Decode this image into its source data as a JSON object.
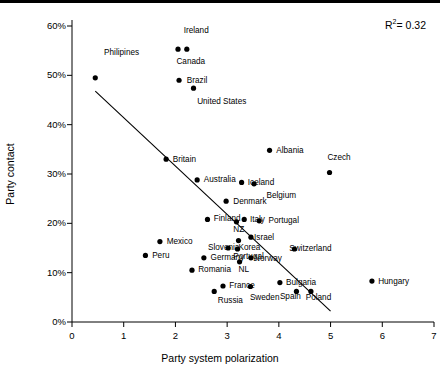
{
  "chart_data": {
    "type": "scatter",
    "title": "",
    "xlabel": "Party system polarization",
    "ylabel": "Party contact",
    "xlim": [
      0,
      7
    ],
    "ylim": [
      0,
      0.6
    ],
    "grid": false,
    "legend": "none",
    "xticks": [
      "0",
      "1",
      "2",
      "3",
      "4",
      "5",
      "6",
      "7"
    ],
    "xtick_values": [
      0,
      1,
      2,
      3,
      4,
      5,
      6,
      7
    ],
    "yticks": [
      "0%",
      "10%",
      "20%",
      "30%",
      "40%",
      "50%",
      "60%"
    ],
    "ytick_values": [
      0,
      0.1,
      0.2,
      0.3,
      0.4,
      0.5,
      0.6
    ],
    "annotations": [
      {
        "name": "r-squared",
        "text": "R2=0.32",
        "r_label": "R",
        "exponent": "2",
        "value": "= 0.32"
      }
    ],
    "trendline": {
      "type": "linear",
      "x_start": 0.45,
      "y_start": 0.468,
      "x_end": 5.0,
      "y_end": 0.022
    },
    "point_color": "#000000",
    "points": [
      {
        "label": "Philipines",
        "x": 0.45,
        "y": 0.495,
        "lx": 0.62,
        "ly": 0.543
      },
      {
        "label": "Ireland",
        "x": 2.05,
        "y": 0.553,
        "lx": 2.16,
        "ly": 0.588
      },
      {
        "label": "Canada",
        "x": 2.22,
        "y": 0.553,
        "lx": 2.02,
        "ly": 0.525
      },
      {
        "label": "Brazil",
        "x": 2.07,
        "y": 0.49,
        "lx": 2.22,
        "ly": 0.487
      },
      {
        "label": "United States",
        "x": 2.35,
        "y": 0.474,
        "lx": 2.42,
        "ly": 0.443
      },
      {
        "label": "Britain",
        "x": 1.82,
        "y": 0.33,
        "lx": 1.95,
        "ly": 0.327
      },
      {
        "label": "Albania",
        "x": 3.82,
        "y": 0.348,
        "lx": 3.95,
        "ly": 0.345
      },
      {
        "label": "Czech",
        "x": 4.98,
        "y": 0.303,
        "lx": 4.94,
        "ly": 0.33
      },
      {
        "label": "Australia",
        "x": 2.42,
        "y": 0.288,
        "lx": 2.55,
        "ly": 0.285
      },
      {
        "label": "Iceland",
        "x": 3.28,
        "y": 0.283,
        "lx": 3.4,
        "ly": 0.28
      },
      {
        "label": "Belgium",
        "x": 3.52,
        "y": 0.28,
        "lx": 3.76,
        "ly": 0.253
      },
      {
        "label": "Denmark",
        "x": 2.98,
        "y": 0.245,
        "lx": 3.12,
        "ly": 0.242
      },
      {
        "label": "Finland",
        "x": 2.62,
        "y": 0.208,
        "lx": 2.74,
        "ly": 0.206
      },
      {
        "label": "NZ",
        "x": 3.18,
        "y": 0.203,
        "lx": 3.12,
        "ly": 0.184
      },
      {
        "label": "Italy",
        "x": 3.33,
        "y": 0.208,
        "lx": 3.44,
        "ly": 0.205
      },
      {
        "label": "Portugal",
        "x": 3.62,
        "y": 0.205,
        "lx": 3.8,
        "ly": 0.203
      },
      {
        "label": "Mexico",
        "x": 1.7,
        "y": 0.163,
        "lx": 1.83,
        "ly": 0.16
      },
      {
        "label": "Korea",
        "x": 3.22,
        "y": 0.165,
        "lx": 3.22,
        "ly": 0.148
      },
      {
        "label": "Israel",
        "x": 3.46,
        "y": 0.172,
        "lx": 3.52,
        "ly": 0.168
      },
      {
        "label": "Slovenia",
        "x": 3.02,
        "y": 0.15,
        "lx": 2.63,
        "ly": 0.148
      },
      {
        "label": "Portugal",
        "x": 3.2,
        "y": 0.148,
        "lx": 3.12,
        "ly": 0.13
      },
      {
        "label": "Switzerland",
        "x": 4.3,
        "y": 0.148,
        "lx": 4.2,
        "ly": 0.145
      },
      {
        "label": "Peru",
        "x": 1.42,
        "y": 0.135,
        "lx": 1.55,
        "ly": 0.132
      },
      {
        "label": "Germany",
        "x": 2.55,
        "y": 0.13,
        "lx": 2.68,
        "ly": 0.128
      },
      {
        "label": "NL",
        "x": 3.24,
        "y": 0.122,
        "lx": 3.22,
        "ly": 0.103
      },
      {
        "label": "Norway",
        "x": 3.46,
        "y": 0.13,
        "lx": 3.52,
        "ly": 0.126
      },
      {
        "label": "Romania",
        "x": 2.32,
        "y": 0.105,
        "lx": 2.44,
        "ly": 0.103
      },
      {
        "label": "France",
        "x": 2.92,
        "y": 0.073,
        "lx": 3.04,
        "ly": 0.07
      },
      {
        "label": "Russia",
        "x": 2.75,
        "y": 0.062,
        "lx": 2.82,
        "ly": 0.04
      },
      {
        "label": "Sweden",
        "x": 3.45,
        "y": 0.072,
        "lx": 3.44,
        "ly": 0.046
      },
      {
        "label": "Bulgaria",
        "x": 4.02,
        "y": 0.08,
        "lx": 4.14,
        "ly": 0.078
      },
      {
        "label": "Spain",
        "x": 4.34,
        "y": 0.062,
        "lx": 4.02,
        "ly": 0.048
      },
      {
        "label": "Poland",
        "x": 4.62,
        "y": 0.062,
        "lx": 4.52,
        "ly": 0.046
      },
      {
        "label": "Hungary",
        "x": 5.8,
        "y": 0.083,
        "lx": 5.92,
        "ly": 0.08
      }
    ]
  }
}
